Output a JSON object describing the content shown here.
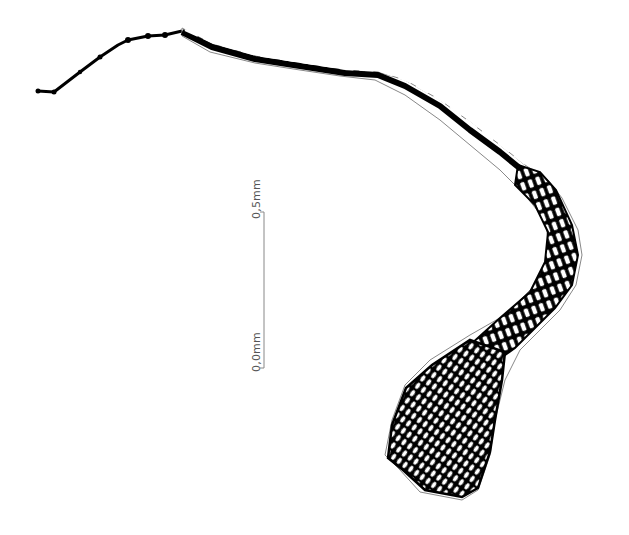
{
  "figure": {
    "ink_color": "#000000",
    "outline_color": "#777777",
    "background": "#ffffff"
  },
  "scale_bar": {
    "top_label": "0,5mm",
    "bottom_label": "0,0mm",
    "line_color": "#888888"
  }
}
